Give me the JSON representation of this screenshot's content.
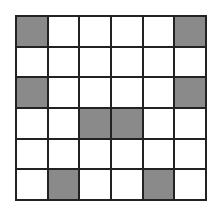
{
  "grid": {
    "rows": 6,
    "cols": 6,
    "shaded_color": "#8a8a8a",
    "empty_color": "#ffffff",
    "cells": [
      [
        1,
        0,
        0,
        0,
        0,
        1
      ],
      [
        0,
        0,
        0,
        0,
        0,
        0
      ],
      [
        1,
        0,
        0,
        0,
        0,
        1
      ],
      [
        0,
        0,
        1,
        1,
        0,
        0
      ],
      [
        0,
        0,
        0,
        0,
        0,
        0
      ],
      [
        0,
        1,
        0,
        0,
        1,
        0
      ]
    ]
  }
}
